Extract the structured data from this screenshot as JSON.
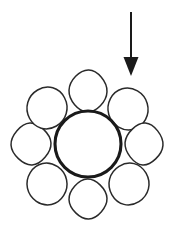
{
  "figure": {
    "title": "Fiber bundle cross-section with applied load arrow",
    "canvas": {
      "width": 174,
      "height": 233,
      "background": "#ffffff"
    },
    "ink_color": "#1a1a1a",
    "fill_color": "#ffffff"
  },
  "core": {
    "name": "central core circle",
    "cx": 88,
    "cy": 144,
    "r": 33,
    "stroke_width": 3.1,
    "stroke": "#1a1a1a"
  },
  "satellites": {
    "count": 8,
    "ring_radius": 56,
    "stroke_width": 1.5,
    "stroke": "#2a2a2a",
    "items": [
      {
        "label": "top",
        "cx": 88,
        "cy": 91,
        "rx": 19,
        "ry": 21,
        "corner": 0.62,
        "rotate": 2
      },
      {
        "label": "upper-right",
        "cx": 128,
        "cy": 109,
        "rx": 20,
        "ry": 21,
        "corner": 0.78,
        "rotate": -16
      },
      {
        "label": "right",
        "cx": 144,
        "cy": 144,
        "rx": 19,
        "ry": 21,
        "corner": 0.56,
        "rotate": 4
      },
      {
        "label": "lower-right",
        "cx": 129,
        "cy": 184,
        "rx": 20,
        "ry": 21,
        "corner": 0.74,
        "rotate": 14
      },
      {
        "label": "bottom",
        "cx": 88,
        "cy": 199,
        "rx": 19,
        "ry": 20,
        "corner": 0.58,
        "rotate": -2
      },
      {
        "label": "lower-left",
        "cx": 47,
        "cy": 184,
        "rx": 20,
        "ry": 21,
        "corner": 0.76,
        "rotate": -12
      },
      {
        "label": "left",
        "cx": 31,
        "cy": 144,
        "rx": 20,
        "ry": 21,
        "corner": 0.55,
        "rotate": -3
      },
      {
        "label": "upper-left",
        "cx": 47,
        "cy": 108,
        "rx": 20,
        "ry": 21,
        "corner": 0.76,
        "rotate": 16
      }
    ]
  },
  "arrow": {
    "name": "load direction arrow",
    "direction": "down",
    "x": 131,
    "y_start": 12,
    "y_tip": 76,
    "shaft_width": 2.0,
    "head_width": 15,
    "head_height": 19,
    "color": "#1a1a1a"
  }
}
